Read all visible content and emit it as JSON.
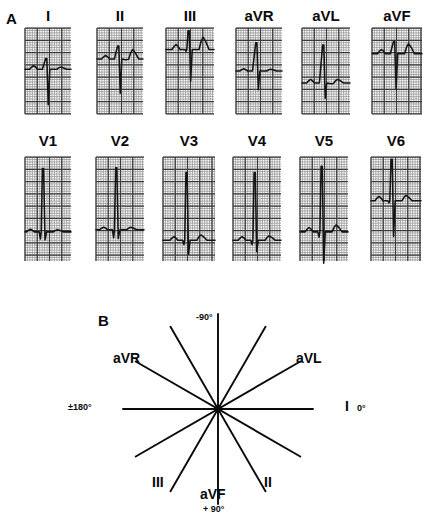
{
  "figure": {
    "panel_a_letter": "A",
    "panel_b_letter": "B"
  },
  "panel_a": {
    "row1": [
      {
        "label": "I",
        "name": "lead-i"
      },
      {
        "label": "II",
        "name": "lead-ii"
      },
      {
        "label": "III",
        "name": "lead-iii"
      },
      {
        "label": "aVR",
        "name": "lead-avr"
      },
      {
        "label": "aVL",
        "name": "lead-avl"
      },
      {
        "label": "aVF",
        "name": "lead-avf"
      }
    ],
    "row2": [
      {
        "label": "V1",
        "name": "lead-v1"
      },
      {
        "label": "V2",
        "name": "lead-v2"
      },
      {
        "label": "V3",
        "name": "lead-v3"
      },
      {
        "label": "V4",
        "name": "lead-v4"
      },
      {
        "label": "V5",
        "name": "lead-v5"
      },
      {
        "label": "V6",
        "name": "lead-v6"
      }
    ]
  },
  "panel_b": {
    "title_letter": "B",
    "axis_labels": [
      {
        "text": "-90°",
        "name": "axis-minus-90"
      },
      {
        "text": "aVR",
        "name": "axis-avr"
      },
      {
        "text": "aVL",
        "name": "axis-avl"
      },
      {
        "text": "±180°",
        "name": "axis-plus-minus-180"
      },
      {
        "text": "I",
        "name": "axis-lead-i"
      },
      {
        "text": "0°",
        "name": "axis-zero"
      },
      {
        "text": "III",
        "name": "axis-iii"
      },
      {
        "text": "aVF",
        "name": "axis-avf"
      },
      {
        "text": "+ 90°",
        "name": "axis-plus-90"
      },
      {
        "text": "II",
        "name": "axis-ii"
      }
    ],
    "axis_angles_deg": [
      0,
      30,
      60,
      90,
      120,
      150,
      180,
      210,
      240,
      270,
      300,
      330
    ],
    "line_count": 6
  },
  "chart_data": {
    "type": "line",
    "xlabel": "time",
    "ylabel": "voltage",
    "grid": true,
    "legend": "none",
    "leads": [
      {
        "name": "I",
        "row": 1,
        "col": 1,
        "r_amplitude": 0.25,
        "s_amplitude": -1.0,
        "t_amplitude": 0.05
      },
      {
        "name": "II",
        "row": 1,
        "col": 2,
        "r_amplitude": 0.3,
        "s_amplitude": -0.95,
        "t_amplitude": 0.22
      },
      {
        "name": "III",
        "row": 1,
        "col": 3,
        "r_amplitude": 0.45,
        "s_amplitude": -0.9,
        "t_amplitude": 0.3
      },
      {
        "name": "aVR",
        "row": 1,
        "col": 4,
        "r_amplitude": 0.7,
        "s_amplitude": -0.55,
        "t_amplitude": 0.04
      },
      {
        "name": "aVL",
        "row": 1,
        "col": 5,
        "r_amplitude": 0.95,
        "s_amplitude": -0.45,
        "t_amplitude": 0.08
      },
      {
        "name": "aVF",
        "row": 1,
        "col": 6,
        "r_amplitude": 0.3,
        "s_amplitude": -0.95,
        "t_amplitude": 0.25
      },
      {
        "name": "V1",
        "row": 2,
        "col": 1,
        "r_amplitude": 1.3,
        "s_amplitude": -0.2,
        "t_amplitude": 0.05
      },
      {
        "name": "V2",
        "row": 2,
        "col": 2,
        "r_amplitude": 1.3,
        "s_amplitude": -0.22,
        "t_amplitude": 0.05
      },
      {
        "name": "V3",
        "row": 2,
        "col": 3,
        "r_amplitude": 1.4,
        "s_amplitude": -0.35,
        "t_amplitude": 0.1
      },
      {
        "name": "V4",
        "row": 2,
        "col": 4,
        "r_amplitude": 1.4,
        "s_amplitude": -0.3,
        "t_amplitude": 0.1
      },
      {
        "name": "V5",
        "row": 2,
        "col": 5,
        "r_amplitude": 1.4,
        "s_amplitude": -0.8,
        "t_amplitude": 0.15
      },
      {
        "name": "V6",
        "row": 2,
        "col": 6,
        "r_amplitude": 0.85,
        "s_amplitude": -0.75,
        "t_amplitude": 0.1
      }
    ]
  },
  "colors": {
    "ink": "#0a0a0a",
    "grid_fine": "#8c8c8c",
    "grid_bold": "#3a3a3a",
    "trace": "#141414",
    "background": "#ffffff"
  }
}
